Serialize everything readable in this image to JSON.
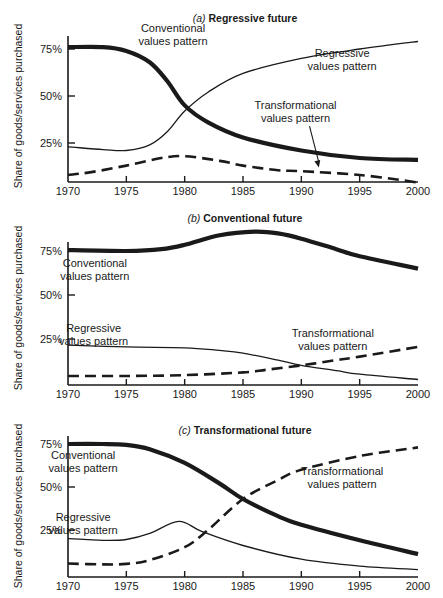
{
  "figure": {
    "y_axis_label": "Share of goods/services purchased",
    "x_ticks": [
      "1970",
      "1975",
      "1980",
      "1985",
      "1990",
      "1995",
      "2000"
    ],
    "y_ticks": [
      "25%",
      "50%",
      "75%"
    ],
    "colors": {
      "ink": "#1a1a1a",
      "background": "#ffffff"
    }
  },
  "chart_data": [
    {
      "type": "line",
      "panel": "a",
      "title_prefix": "(a)",
      "title": "Regressive future",
      "xlabel": "",
      "ylabel": "Share of goods/services purchased",
      "xlim": [
        1970,
        2000
      ],
      "ylim": [
        0,
        80
      ],
      "grid": false,
      "legend": "inline annotations",
      "series": [
        {
          "name": "Conventional values pattern",
          "style": "thick-solid",
          "x": [
            1970,
            1973,
            1975,
            1977,
            1978.5,
            1980,
            1982,
            1985,
            1990,
            1995,
            2000
          ],
          "values": [
            76,
            76,
            74,
            68,
            58,
            45,
            36,
            28,
            21,
            17,
            16
          ]
        },
        {
          "name": "Regressive values pattern",
          "style": "thin-solid",
          "x": [
            1970,
            1973,
            1975,
            1977,
            1978.5,
            1980,
            1982,
            1985,
            1990,
            1995,
            2000
          ],
          "values": [
            23,
            21.5,
            21,
            24,
            31,
            42,
            52,
            62,
            70,
            75,
            79
          ]
        },
        {
          "name": "Transformational values pattern",
          "style": "dashed",
          "x": [
            1970,
            1972,
            1975,
            1978,
            1980,
            1983,
            1985,
            1988,
            1990,
            1995,
            2000
          ],
          "values": [
            8,
            9.5,
            13,
            17,
            18,
            15.5,
            13,
            10.5,
            10,
            8,
            4
          ]
        }
      ],
      "annotations": [
        {
          "lines": [
            "Conventional",
            "values pattern"
          ],
          "x": 1979,
          "y": 84
        },
        {
          "lines": [
            "Regressive",
            "values pattern"
          ],
          "x": 1993.5,
          "y": 71
        },
        {
          "lines": [
            "Transformational",
            "values pattern"
          ],
          "x": 1989.5,
          "y": 43,
          "arrow_to": [
            1991.5,
            12
          ]
        }
      ]
    },
    {
      "type": "line",
      "panel": "b",
      "title_prefix": "(b)",
      "title": "Conventional future",
      "xlabel": "",
      "ylabel": "Share of goods/services purchased",
      "xlim": [
        1970,
        2000
      ],
      "ylim": [
        0,
        80
      ],
      "grid": false,
      "legend": "inline annotations",
      "series": [
        {
          "name": "Conventional values pattern",
          "style": "thick-solid",
          "x": [
            1970,
            1975,
            1978,
            1980,
            1983,
            1986,
            1988,
            1990,
            1993,
            1995,
            2000
          ],
          "values": [
            75.5,
            75,
            76,
            78.5,
            84,
            86,
            85,
            82,
            76,
            72,
            65
          ]
        },
        {
          "name": "Regressive values pattern",
          "style": "thin-solid",
          "x": [
            1970,
            1975,
            1980,
            1983,
            1985,
            1988,
            1990,
            1993,
            1995,
            2000
          ],
          "values": [
            21.5,
            20.5,
            20,
            18.5,
            17,
            13,
            10,
            7,
            5,
            2
          ]
        },
        {
          "name": "Transformational values pattern",
          "style": "dashed",
          "x": [
            1970,
            1975,
            1980,
            1985,
            1987,
            1990,
            1993,
            1995,
            2000
          ],
          "values": [
            4,
            4,
            4.5,
            6,
            7.5,
            10,
            13,
            15,
            20.5
          ]
        }
      ],
      "annotations": [
        {
          "lines": [
            "Conventional",
            "values pattern"
          ],
          "x": 1972.3,
          "y": 66
        },
        {
          "lines": [
            "Regressive",
            "values pattern"
          ],
          "x": 1972.2,
          "y": 29
        },
        {
          "lines": [
            "Transformational",
            "values pattern"
          ],
          "x": 1992.7,
          "y": 26
        }
      ]
    },
    {
      "type": "line",
      "panel": "c",
      "title_prefix": "(c)",
      "title": "Transformational future",
      "xlabel": "",
      "ylabel": "Share of goods/services purchased",
      "xlim": [
        1970,
        2000
      ],
      "ylim": [
        0,
        80
      ],
      "grid": false,
      "legend": "inline annotations",
      "series": [
        {
          "name": "Conventional values pattern",
          "style": "thick-solid",
          "x": [
            1970,
            1973,
            1975,
            1977,
            1980,
            1983,
            1985,
            1988,
            1990,
            1995,
            2000
          ],
          "values": [
            75,
            75,
            74.5,
            72,
            64,
            52,
            43,
            33,
            28,
            19,
            11
          ]
        },
        {
          "name": "Regressive values pattern",
          "style": "thin-solid",
          "x": [
            1970,
            1973,
            1975,
            1977,
            1979.5,
            1981.5,
            1985,
            1990,
            1995,
            2000
          ],
          "values": [
            20,
            19,
            19.5,
            23,
            30,
            24,
            16,
            8,
            4,
            2
          ]
        },
        {
          "name": "Transformational values pattern",
          "style": "dashed",
          "x": [
            1970,
            1973,
            1975,
            1977,
            1980,
            1982,
            1985,
            1988,
            1990,
            1995,
            2000
          ],
          "values": [
            5.5,
            5,
            5.3,
            7.5,
            15,
            25,
            43,
            54,
            60,
            68,
            73
          ]
        }
      ],
      "annotations": [
        {
          "lines": [
            "Conventional",
            "values pattern"
          ],
          "x": 1971.3,
          "y": 66
        },
        {
          "lines": [
            "Regressive",
            "values pattern"
          ],
          "x": 1971.3,
          "y": 30
        },
        {
          "lines": [
            "Transformational",
            "values pattern"
          ],
          "x": 1993.5,
          "y": 57
        }
      ]
    }
  ]
}
